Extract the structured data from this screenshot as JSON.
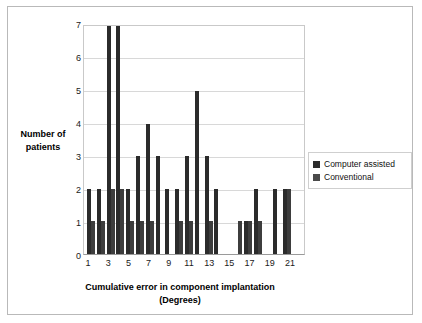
{
  "chart_data": {
    "type": "bar",
    "title": "",
    "xlabel_line1": "Cumulative error in component implantation",
    "xlabel_line2": "(Degrees)",
    "ylabel_line1": "Number of",
    "ylabel_line2": "patients",
    "categories": [
      "1",
      "2",
      "3",
      "4",
      "5",
      "6",
      "7",
      "8",
      "9",
      "10",
      "11",
      "12",
      "13",
      "14",
      "15",
      "16",
      "17",
      "18",
      "19",
      "20",
      "21",
      "22"
    ],
    "xtick_labels": [
      "1",
      "",
      "3",
      "",
      "5",
      "",
      "7",
      "",
      "9",
      "",
      "11",
      "",
      "13",
      "",
      "15",
      "",
      "17",
      "",
      "19",
      "",
      "21",
      ""
    ],
    "ytick_labels": [
      "7",
      "6",
      "5",
      "4",
      "3",
      "2",
      "1",
      "0"
    ],
    "ylim": [
      0,
      7
    ],
    "grid": true,
    "legend_position": "right",
    "series": [
      {
        "name": "Computer assisted",
        "color": "#2b2b2b",
        "values": [
          2,
          2,
          7,
          7,
          2,
          3,
          4,
          3,
          2,
          2,
          3,
          5,
          3,
          2,
          0,
          0,
          1,
          2,
          0,
          2,
          2,
          0
        ]
      },
      {
        "name": "Conventional",
        "color": "#4a4a4a",
        "values": [
          1,
          1,
          2,
          2,
          1,
          1,
          1,
          0,
          0,
          1,
          1,
          0,
          1,
          0,
          0,
          1,
          1,
          1,
          0,
          0,
          2,
          0
        ]
      }
    ]
  },
  "legend": {
    "items": [
      {
        "label": "Computer assisted",
        "swatch": "legend-swatch-computer-assisted"
      },
      {
        "label": "Conventional",
        "swatch": "legend-swatch-conventional"
      }
    ]
  }
}
